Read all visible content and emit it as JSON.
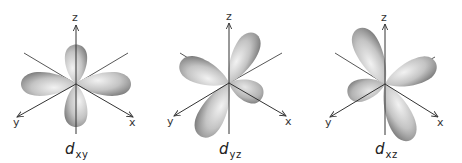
{
  "figure": {
    "panels": [
      {
        "id": "dxy",
        "label_main": "d",
        "label_sub": "xy",
        "axes": {
          "z": "z",
          "x": "x",
          "y": "y"
        }
      },
      {
        "id": "dyz",
        "label_main": "d",
        "label_sub": "yz",
        "axes": {
          "z": "z",
          "x": "x",
          "y": "y"
        }
      },
      {
        "id": "dxz",
        "label_main": "d",
        "label_sub": "xz",
        "axes": {
          "z": "z",
          "x": "x",
          "y": "y"
        }
      }
    ],
    "colors": {
      "lobe_light": "#e8e8e8",
      "lobe_dark": "#8a8a8a",
      "axis": "#333333"
    }
  }
}
